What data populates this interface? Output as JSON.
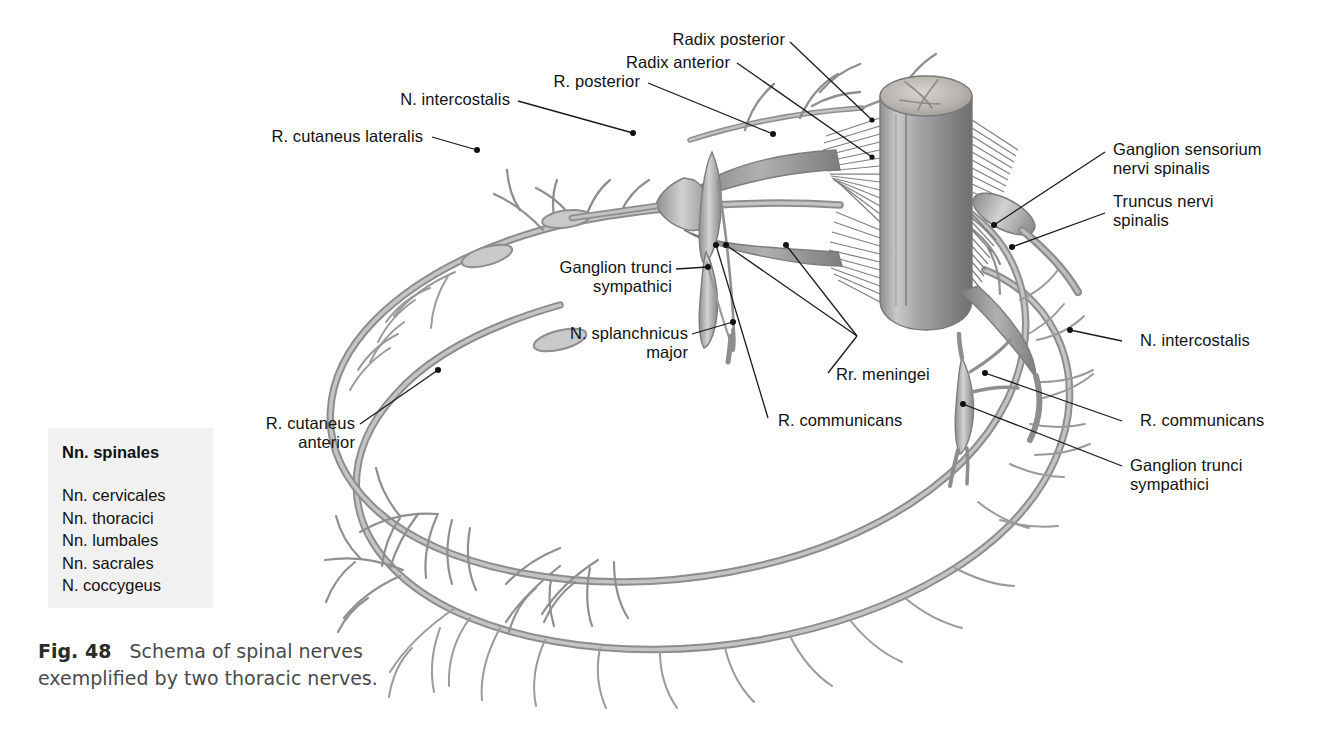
{
  "figure": {
    "caption_label": "Fig. 48",
    "caption_text": "Schema of spinal nerves exemplified by two thoracic nerves."
  },
  "legend": {
    "title": "Nn. spinales",
    "items": [
      "Nn. cervicales",
      "Nn. thoracici",
      "Nn. lumbales",
      "Nn. sacrales",
      "N. coccygeus"
    ]
  },
  "labels": {
    "radix_posterior": "Radix posterior",
    "radix_anterior": "Radix anterior",
    "r_posterior": "R. posterior",
    "n_intercostalis_left": "N. intercostalis",
    "r_cutaneus_lateralis": "R. cutaneus lateralis",
    "ganglion_sensorium": "Ganglion sensorium\nnervi spinalis",
    "truncus_nervi_spinalis": "Truncus nervi\nspinalis",
    "n_intercostalis_right": "N. intercostalis",
    "ganglion_trunci_left": "Ganglion trunci\nsympathici",
    "n_splanchnicus_major": "N. splanchnicus\nmajor",
    "rr_meningei": "Rr. meningei",
    "r_communicans_center": "R. communicans",
    "r_communicans_right": "R. communicans",
    "ganglion_trunci_right": "Ganglion trunci\nsympathici",
    "r_cutaneus_anterior": "R. cutaneus\nanterior"
  },
  "colors": {
    "nerve_stroke": "#8d8d8d",
    "nerve_fill": "#b8b8b8",
    "cord_fill": "#9a9a9a",
    "cord_top": "#bdbdbd",
    "leader_line": "#1a1a1a",
    "legend_bg": "#f1f1f1",
    "text": "#111111",
    "caption_text": "#4a4a4a"
  }
}
